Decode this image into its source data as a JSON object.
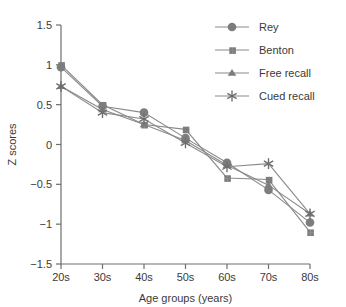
{
  "chart_data": {
    "type": "line",
    "title": "",
    "xlabel": "Age groups (years)",
    "ylabel": "Z scores",
    "categories": [
      "20s",
      "30s",
      "40s",
      "50s",
      "60s",
      "70s",
      "80s"
    ],
    "ylim": [
      -1.5,
      1.5
    ],
    "yticks": [
      "1.5",
      "1",
      "0.5",
      "0",
      "-0.5",
      "-1",
      "-1.5"
    ],
    "ytick_values": [
      1.5,
      1,
      0.5,
      0,
      -0.5,
      -1,
      -1.5
    ],
    "grid": false,
    "legend_position": "top-right",
    "series": [
      {
        "name": "Rey",
        "marker": "circle",
        "color": "#7d7d7d",
        "values": [
          0.97,
          0.48,
          0.4,
          0.08,
          -0.23,
          -0.57,
          -0.98
        ]
      },
      {
        "name": "Benton",
        "marker": "square",
        "color": "#7d7d7d",
        "values": [
          1.0,
          0.5,
          0.25,
          0.19,
          -0.42,
          -0.44,
          -1.1
        ]
      },
      {
        "name": "Free recall",
        "marker": "triangle",
        "color": "#7d7d7d",
        "values": [
          0.73,
          0.44,
          0.25,
          0.05,
          -0.26,
          -0.51,
          -0.87
        ]
      },
      {
        "name": "Cued recall",
        "marker": "star",
        "color": "#6f6f6f",
        "values": [
          0.73,
          0.4,
          0.32,
          0.02,
          -0.28,
          -0.24,
          -0.87
        ]
      }
    ]
  },
  "legend": {
    "items": [
      {
        "label": "Rey",
        "marker": "circle"
      },
      {
        "label": "Benton",
        "marker": "square"
      },
      {
        "label": "Free recall",
        "marker": "triangle"
      },
      {
        "label": "Cued recall",
        "marker": "star"
      }
    ]
  }
}
